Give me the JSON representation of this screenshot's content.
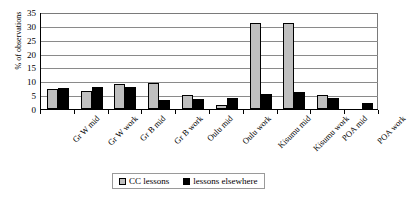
{
  "chart_data": {
    "type": "bar",
    "title": "",
    "xlabel": "",
    "ylabel": "% of observations",
    "ylim": [
      0,
      35
    ],
    "yticks": [
      0,
      5,
      10,
      15,
      20,
      25,
      30,
      35
    ],
    "grid": true,
    "legend_position": "bottom",
    "categories": [
      "Gr W mid",
      "Gr W work",
      "Gr B mid",
      "Gr B work",
      "Oulu mid",
      "Oulu work",
      "Kisumu mid",
      "Kisumu work",
      "POA mid",
      "POA work"
    ],
    "series": [
      {
        "name": "CC lessons",
        "color": "#bfbfbf",
        "values": [
          7.2,
          6.5,
          9.0,
          9.3,
          5.2,
          1.5,
          31.0,
          31.0,
          5.0,
          0.0
        ]
      },
      {
        "name": "lessons elsewhere",
        "color": "#000000",
        "values": [
          7.5,
          8.0,
          7.9,
          3.3,
          3.5,
          4.0,
          5.5,
          6.0,
          4.0,
          2.0
        ]
      }
    ]
  },
  "legend": {
    "entries": [
      {
        "label": "CC lessons"
      },
      {
        "label": "lessons elsewhere"
      }
    ]
  },
  "colors": {
    "series_light": "#bfbfbf",
    "series_dark": "#000000",
    "gridline": "#8a8a8a",
    "axis": "#000000",
    "background": "#ffffff"
  }
}
